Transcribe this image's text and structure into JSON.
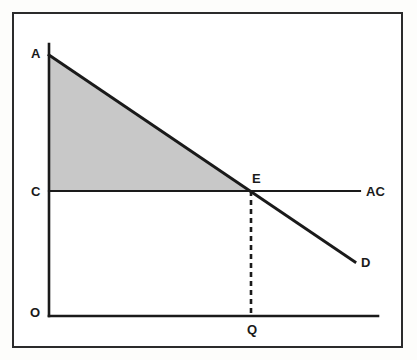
{
  "figure": {
    "kind": "economics-diagram",
    "background_color": "#ffffff",
    "page_color": "#fdfdfb",
    "frame_color": "#2b2b2b",
    "line_color": "#1a1a1a",
    "shade_color": "#c8c8c8"
  },
  "labels": {
    "origin": "O",
    "demand_intercept": "A",
    "cost_intercept": "C",
    "equilibrium": "E",
    "quantity": "Q",
    "average_cost_curve": "AC",
    "demand_curve": "D"
  },
  "chart_data": {
    "type": "line",
    "title": "",
    "xlabel": "",
    "ylabel": "",
    "grid": false,
    "legend": "inline-curve-labels",
    "axes": {
      "x_axis": {
        "from": [
          49,
          316
        ],
        "to": [
          378,
          316
        ]
      },
      "y_axis": {
        "from": [
          49,
          44
        ],
        "to": [
          49,
          316
        ]
      }
    },
    "series": [
      {
        "name": "D",
        "label": "D",
        "kind": "demand",
        "points": [
          [
            49,
            55
          ],
          [
            355,
            262
          ]
        ],
        "style": "solid"
      },
      {
        "name": "AC",
        "label": "AC",
        "kind": "average-cost",
        "points": [
          [
            49,
            191
          ],
          [
            360,
            191
          ]
        ],
        "style": "solid"
      },
      {
        "name": "quantity-drop",
        "label": "Q",
        "kind": "guide",
        "points": [
          [
            251,
            191
          ],
          [
            251,
            316
          ]
        ],
        "style": "dashed"
      }
    ],
    "annotations": [
      {
        "label": "A",
        "at": [
          49,
          55
        ],
        "meaning": "demand vertical intercept"
      },
      {
        "label": "C",
        "at": [
          49,
          191
        ],
        "meaning": "average cost level on vertical axis"
      },
      {
        "label": "O",
        "at": [
          49,
          316
        ],
        "meaning": "origin"
      },
      {
        "label": "E",
        "at": [
          251,
          191
        ],
        "meaning": "demand meets average cost"
      },
      {
        "label": "Q",
        "at": [
          251,
          316
        ],
        "meaning": "equilibrium quantity on horizontal axis"
      },
      {
        "label": "AC",
        "at": [
          360,
          191
        ],
        "meaning": "average cost curve label"
      },
      {
        "label": "D",
        "at": [
          355,
          262
        ],
        "meaning": "demand curve label"
      }
    ],
    "shaded_region": {
      "name": "consumer-surplus-triangle",
      "vertices": [
        [
          49,
          55
        ],
        [
          251,
          191
        ],
        [
          49,
          191
        ]
      ],
      "fill": "#c8c8c8"
    }
  }
}
